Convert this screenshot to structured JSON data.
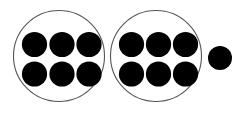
{
  "canvas": {
    "width": 242,
    "height": 117,
    "background_color": "#ffffff"
  },
  "style": {
    "group_outline_color": "#555555",
    "group_outline_width": 1.1,
    "group_fill_color": "#ffffff",
    "counter_fill_color": "#000000",
    "counter_outline_color": "#000000"
  },
  "title": "",
  "caption": "",
  "labels": {
    "group_1": "",
    "group_2": "",
    "loose_counter": ""
  },
  "chart_data": {
    "type": "scatter",
    "title": "",
    "xlabel": "",
    "ylabel": "",
    "grid": false,
    "legend": "none",
    "xlim": [
      0,
      242
    ],
    "ylim": [
      0,
      117
    ],
    "total_counters": 13,
    "groups": [
      {
        "name": "group-1",
        "label": "",
        "count": 6,
        "outline": {
          "shape": "circle",
          "cx": 59.0,
          "cy": 56.0,
          "rx": 45.5,
          "ry": 45.5
        },
        "counter_radius": 12.6,
        "counters": [
          {
            "cx": 34.5,
            "cy": 44.5
          },
          {
            "cx": 62.0,
            "cy": 44.5
          },
          {
            "cx": 89.0,
            "cy": 44.5
          },
          {
            "cx": 34.5,
            "cy": 74.0
          },
          {
            "cx": 62.0,
            "cy": 74.0
          },
          {
            "cx": 89.0,
            "cy": 74.0
          }
        ]
      },
      {
        "name": "group-2",
        "label": "",
        "count": 6,
        "outline": {
          "shape": "circle",
          "cx": 156.0,
          "cy": 56.0,
          "rx": 45.5,
          "ry": 45.5
        },
        "counter_radius": 12.6,
        "counters": [
          {
            "cx": 131.5,
            "cy": 44.5
          },
          {
            "cx": 158.5,
            "cy": 44.5
          },
          {
            "cx": 185.5,
            "cy": 44.5
          },
          {
            "cx": 131.5,
            "cy": 74.0
          },
          {
            "cx": 158.5,
            "cy": 74.0
          },
          {
            "cx": 185.5,
            "cy": 74.0
          }
        ]
      }
    ],
    "loose_counters": [
      {
        "name": "loose-counter-1",
        "label": "",
        "cx": 220.0,
        "cy": 58.0,
        "r": 12.0
      }
    ],
    "values": [
      6,
      6,
      1
    ],
    "categories": [
      "group-1",
      "group-2",
      "loose-counter-1"
    ]
  },
  "alt_text": "Two circles each holding six black dots, and one black dot outside the circles, thirteen dots in total."
}
